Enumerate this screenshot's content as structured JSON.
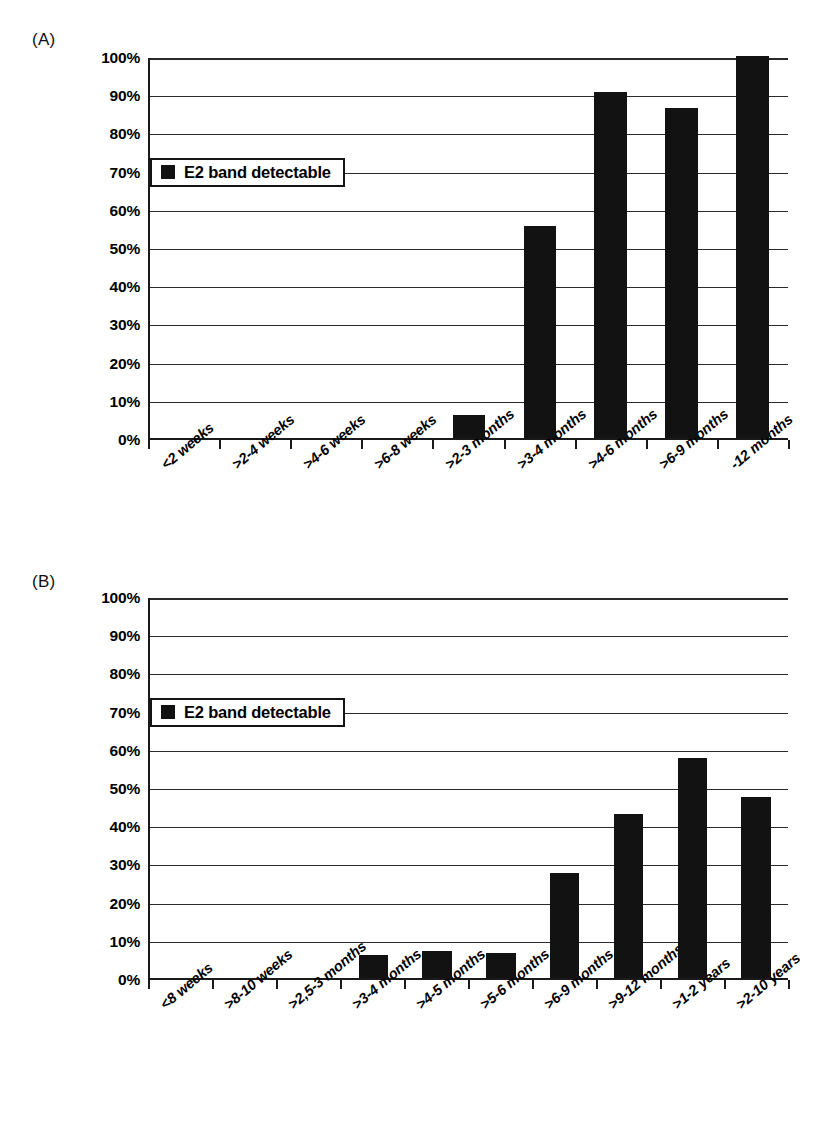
{
  "figure": {
    "background": "#ffffff",
    "bar_color": "#121212",
    "axis_color": "#1a1a1a"
  },
  "panels": [
    {
      "key": "A",
      "label": "(A)",
      "legend": {
        "label": "E2 band detectable",
        "swatch_color": "#121212"
      }
    },
    {
      "key": "B",
      "label": "(B)",
      "legend": {
        "label": "E2 band detectable",
        "swatch_color": "#121212"
      }
    }
  ],
  "chart_data": [
    {
      "type": "bar",
      "panel": "A",
      "title": "",
      "xlabel": "",
      "ylabel": "",
      "ylim": [
        0,
        100
      ],
      "ytick_labels": [
        "0%",
        "10%",
        "20%",
        "30%",
        "40%",
        "50%",
        "60%",
        "70%",
        "80%",
        "90%",
        "100%"
      ],
      "ytick_values": [
        0,
        10,
        20,
        30,
        40,
        50,
        60,
        70,
        80,
        90,
        100
      ],
      "grid": true,
      "legend": [
        "E2 band detectable"
      ],
      "legend_position": "upper-left-inside",
      "categories": [
        "<2 weeks",
        ">2-4 weeks",
        ">4-6 weeks",
        ">6-8 weeks",
        ">2-3 months",
        ">3-4 months",
        ">4-6 months",
        ">6-9 months",
        "-12 months"
      ],
      "series": [
        {
          "name": "E2 band detectable",
          "values": [
            0,
            0,
            0,
            0,
            6,
            55.5,
            90.5,
            86.5,
            100
          ]
        }
      ]
    },
    {
      "type": "bar",
      "panel": "B",
      "title": "",
      "xlabel": "",
      "ylabel": "",
      "ylim": [
        0,
        100
      ],
      "ytick_labels": [
        "0%",
        "10%",
        "20%",
        "30%",
        "40%",
        "50%",
        "60%",
        "70%",
        "80%",
        "90%",
        "100%"
      ],
      "ytick_values": [
        0,
        10,
        20,
        30,
        40,
        50,
        60,
        70,
        80,
        90,
        100
      ],
      "grid": true,
      "legend": [
        "E2 band detectable"
      ],
      "legend_position": "upper-left-inside",
      "categories": [
        "<8 weeks",
        ">8-10 weeks",
        ">2,5-3 months",
        ">3-4 months",
        ">4-5 months",
        ">5-6 months",
        ">6-9 months",
        ">9-12 months",
        ">1-2 years",
        ">2-10 years"
      ],
      "series": [
        {
          "name": "E2 band detectable",
          "values": [
            0,
            0,
            0,
            6,
            7,
            6.5,
            27.5,
            43,
            57.5,
            47.5
          ]
        }
      ]
    }
  ]
}
